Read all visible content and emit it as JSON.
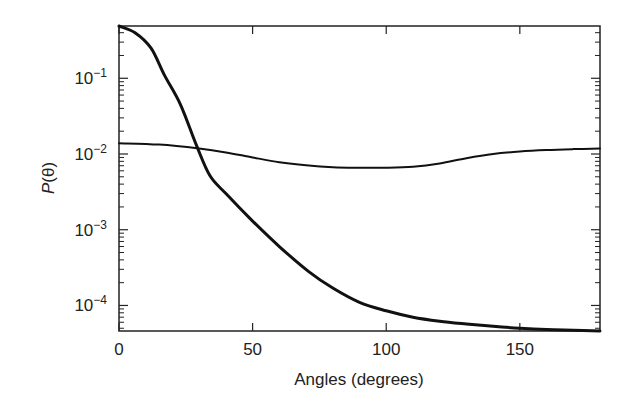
{
  "chart_data": {
    "type": "line",
    "title": "",
    "xlabel": "Angles (degrees)",
    "ylabel": "P(θ)",
    "ylabel_italic_part": "P",
    "ylabel_rest": "(θ)",
    "xlim": [
      0,
      180
    ],
    "ylim": [
      4.6e-05,
      0.49
    ],
    "yscale": "log",
    "grid": false,
    "legend": null,
    "x_ticks": [
      0,
      50,
      100,
      150
    ],
    "x_tick_labels": [
      "0",
      "50",
      "100",
      "150"
    ],
    "y_ticks": [
      0.1,
      0.01,
      0.001,
      0.0001
    ],
    "y_tick_labels": [
      {
        "base": "10",
        "exp": "−1"
      },
      {
        "base": "10",
        "exp": "−2"
      },
      {
        "base": "10",
        "exp": "−3"
      },
      {
        "base": "10",
        "exp": "−4"
      }
    ],
    "series": [
      {
        "name": "forward-peaked phase function (thick)",
        "stroke_width": 3,
        "color": "#111111",
        "x": [
          0,
          6,
          12,
          17,
          23,
          29,
          34,
          40,
          50,
          60,
          71,
          80,
          90,
          100,
          110,
          120,
          130,
          140,
          150,
          160,
          170,
          180
        ],
        "y": [
          0.49,
          0.4,
          0.25,
          0.11,
          0.045,
          0.013,
          0.0052,
          0.003,
          0.0013,
          0.0006,
          0.00028,
          0.00017,
          0.00011,
          8.5e-05,
          7e-05,
          6.2e-05,
          5.7e-05,
          5.3e-05,
          5e-05,
          4.8e-05,
          4.7e-05,
          4.6e-05
        ]
      },
      {
        "name": "nearly isotropic phase function (thin)",
        "stroke_width": 2,
        "color": "#111111",
        "x": [
          0,
          15,
          30,
          40,
          50,
          60,
          70,
          80,
          90,
          100,
          110,
          120,
          130,
          140,
          150,
          160,
          170,
          180
        ],
        "y": [
          0.0139,
          0.0133,
          0.0118,
          0.0105,
          0.009,
          0.0078,
          0.0071,
          0.0067,
          0.0066,
          0.0066,
          0.0068,
          0.0075,
          0.0088,
          0.01,
          0.0108,
          0.0113,
          0.0116,
          0.0118
        ]
      }
    ]
  },
  "layout": {
    "plot_left": 119,
    "plot_right": 600,
    "plot_top": 26,
    "plot_bottom": 331,
    "axis_color": "#222222"
  }
}
